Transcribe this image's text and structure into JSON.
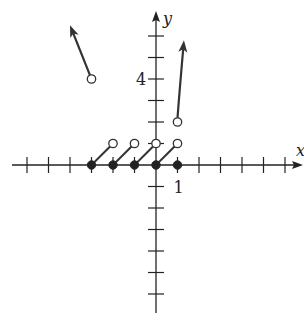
{
  "chart_data": {
    "type": "line",
    "title": "",
    "xlabel": "x",
    "ylabel": "y",
    "xlim": [
      -7,
      7
    ],
    "ylim": [
      -7,
      7
    ],
    "x_ticks": [
      -6,
      -5,
      -4,
      -3,
      -2,
      -1,
      1,
      2,
      3,
      4,
      5,
      6
    ],
    "y_ticks": [
      -6,
      -5,
      -4,
      -3,
      -2,
      -1,
      1,
      2,
      3,
      4,
      5,
      6
    ],
    "tick_labels": [
      {
        "axis": "y",
        "value": 4,
        "text": "4"
      },
      {
        "axis": "x",
        "value": 1,
        "text": "1"
      }
    ],
    "grid": false,
    "series": [
      {
        "name": "segment-1",
        "kind": "segment",
        "from": [
          -3,
          0
        ],
        "to": [
          -2,
          1
        ],
        "from_closed": true,
        "to_closed": false
      },
      {
        "name": "segment-2",
        "kind": "segment",
        "from": [
          -2,
          0
        ],
        "to": [
          -1,
          1
        ],
        "from_closed": true,
        "to_closed": false
      },
      {
        "name": "segment-3",
        "kind": "segment",
        "from": [
          -1,
          0
        ],
        "to": [
          0,
          1
        ],
        "from_closed": true,
        "to_closed": false
      },
      {
        "name": "segment-4",
        "kind": "segment",
        "from": [
          0,
          0
        ],
        "to": [
          1,
          1
        ],
        "from_closed": true,
        "to_closed": false
      },
      {
        "name": "point-1-0",
        "kind": "point",
        "at": [
          1,
          0
        ],
        "closed": true
      },
      {
        "name": "left-ray",
        "kind": "ray",
        "from": [
          -3,
          4
        ],
        "from_closed": false,
        "toward": [
          -4,
          6.5
        ]
      },
      {
        "name": "right-curve",
        "kind": "curve",
        "points": [
          [
            1,
            2
          ],
          [
            1.1,
            3.5
          ],
          [
            1.3,
            5.8
          ]
        ],
        "from_closed": false
      }
    ]
  }
}
